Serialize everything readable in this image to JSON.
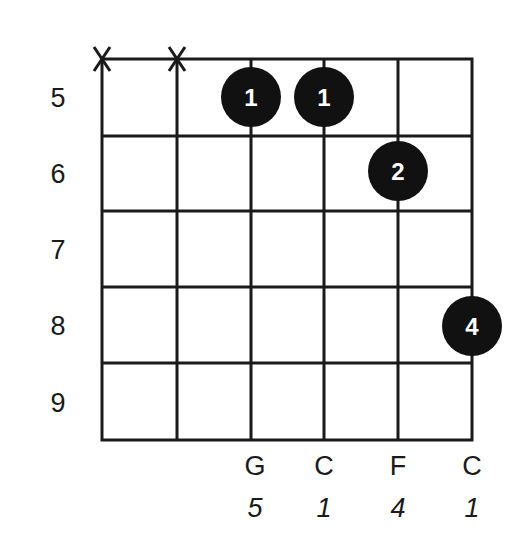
{
  "diagram": {
    "type": "guitar-chord-diagram",
    "fret_numbers": [
      "5",
      "6",
      "7",
      "8",
      "9"
    ],
    "muted_strings": [
      {
        "string": 6,
        "symbol": "X"
      },
      {
        "string": 5,
        "symbol": "X"
      }
    ],
    "fingers": [
      {
        "string": 4,
        "fret": 5,
        "finger": "1"
      },
      {
        "string": 3,
        "fret": 5,
        "finger": "1"
      },
      {
        "string": 2,
        "fret": 6,
        "finger": "2"
      },
      {
        "string": 1,
        "fret": 8,
        "finger": "4"
      }
    ],
    "notes": [
      {
        "string": 4,
        "note": "G",
        "interval": "5"
      },
      {
        "string": 3,
        "note": "C",
        "interval": "1"
      },
      {
        "string": 2,
        "note": "F",
        "interval": "4"
      },
      {
        "string": 1,
        "note": "C",
        "interval": "1"
      }
    ],
    "colors": {
      "line": "#1a1a1a",
      "dot": "#111111",
      "dot_text": "#ffffff",
      "background": "#ffffff"
    }
  }
}
